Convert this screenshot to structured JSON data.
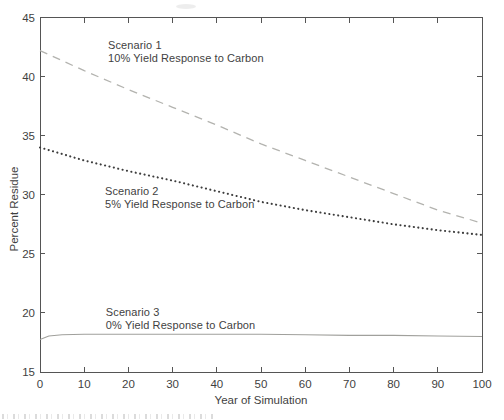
{
  "figure": {
    "background": "#ffffff",
    "axis_color": "#555555",
    "text_color": "#3f3f3f"
  },
  "chart_data": {
    "type": "line",
    "title": "",
    "xlabel": "Year of Simulation",
    "ylabel": "Percent Residue",
    "xlim": [
      0,
      100
    ],
    "ylim": [
      15,
      45
    ],
    "xticks": [
      0,
      10,
      20,
      30,
      40,
      50,
      60,
      70,
      80,
      90,
      100
    ],
    "yticks": [
      15,
      20,
      25,
      30,
      35,
      40,
      45
    ],
    "grid": false,
    "legend_position": "inline-annotations",
    "x": [
      0,
      10,
      20,
      30,
      40,
      50,
      60,
      70,
      80,
      90,
      100
    ],
    "series": [
      {
        "name": "scenario-1",
        "annotation": [
          "Scenario 1",
          "10% Yield Response to Carbon"
        ],
        "style": "dashed",
        "color": "#b3b3af",
        "values": [
          42.2,
          40.5,
          38.9,
          37.4,
          35.9,
          34.3,
          32.9,
          31.5,
          30.1,
          28.7,
          27.6
        ],
        "annotation_pos": {
          "x": 15.4,
          "y": 43.2
        }
      },
      {
        "name": "scenario-2",
        "annotation": [
          "Scenario 2",
          "5% Yield Response to Carbon"
        ],
        "style": "dotted",
        "color": "#3d3d3d",
        "values": [
          34.0,
          32.9,
          32.0,
          31.2,
          30.3,
          29.4,
          28.7,
          28.1,
          27.5,
          27.0,
          26.6
        ],
        "annotation_pos": {
          "x": 14.7,
          "y": 30.8
        }
      },
      {
        "name": "scenario-3",
        "annotation": [
          "Scenario 3",
          "0% Yield Response to Carbon"
        ],
        "style": "solid",
        "color": "#a0a09c",
        "x": [
          0,
          2,
          5,
          10,
          20,
          30,
          40,
          50,
          60,
          70,
          80,
          90,
          100
        ],
        "values": [
          17.75,
          18.05,
          18.15,
          18.2,
          18.2,
          18.2,
          18.2,
          18.2,
          18.15,
          18.1,
          18.1,
          18.05,
          18.0
        ],
        "annotation_pos": {
          "x": 14.9,
          "y": 20.6
        }
      }
    ]
  }
}
